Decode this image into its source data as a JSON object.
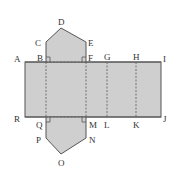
{
  "diagram": {
    "type": "net-of-pentagonal-prism",
    "colors": {
      "fill": "#cfcfcf",
      "stroke": "#555555",
      "dashed": "#666666",
      "label": "#333333"
    },
    "labels": {
      "A": "A",
      "B": "B",
      "C": "C",
      "D": "D",
      "E": "E",
      "F": "F",
      "G": "G",
      "H": "H",
      "I": "I",
      "J": "J",
      "K": "K",
      "L": "L",
      "M": "M",
      "N": "N",
      "O": "O",
      "P": "P",
      "Q": "Q",
      "R": "R"
    }
  }
}
